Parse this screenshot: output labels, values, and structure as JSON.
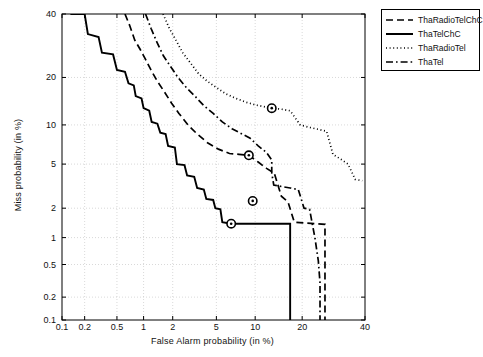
{
  "chart_data": {
    "type": "line",
    "title": "",
    "xlabel": "False Alarm probability (in %)",
    "ylabel": "Miss probability (in %)",
    "scale": "normal-deviate (DET)",
    "xlim": [
      0.1,
      40
    ],
    "ylim": [
      0.1,
      40
    ],
    "xticks": [
      "0.1",
      "0.2",
      "0.5",
      "1",
      "2",
      "5",
      "10",
      "20",
      "40"
    ],
    "xtick_values": [
      0.1,
      0.2,
      0.5,
      1,
      2,
      5,
      10,
      20,
      40
    ],
    "yticks": [
      "40",
      "20",
      "10",
      "5",
      "2",
      "1",
      "0.5",
      "0.2",
      "0.1"
    ],
    "ytick_values": [
      40,
      20,
      10,
      5,
      2,
      1,
      0.5,
      0.2,
      0.1
    ],
    "grid": true,
    "legend_position": "top-right-outside",
    "series": [
      {
        "name": "ThaRadioTelChC",
        "style": "dashed",
        "color": "#000000",
        "eer_marker": {
          "x": 9.0,
          "y": 5.9
        },
        "points": [
          [
            0.62,
            40.0
          ],
          [
            0.7,
            36.0
          ],
          [
            0.8,
            31.0
          ],
          [
            0.92,
            28.0
          ],
          [
            1.05,
            25.0
          ],
          [
            1.2,
            22.0
          ],
          [
            1.4,
            19.0
          ],
          [
            1.65,
            16.5
          ],
          [
            1.95,
            14.0
          ],
          [
            2.3,
            12.0
          ],
          [
            2.8,
            10.0
          ],
          [
            3.4,
            8.6
          ],
          [
            4.2,
            7.4
          ],
          [
            5.2,
            6.6
          ],
          [
            6.4,
            6.1
          ],
          [
            7.6,
            6.0
          ],
          [
            9.0,
            5.9
          ],
          [
            10.5,
            5.2
          ],
          [
            12.0,
            4.6
          ],
          [
            13.5,
            4.2
          ],
          [
            15.0,
            2.6
          ],
          [
            16.5,
            2.3
          ],
          [
            18.0,
            1.45
          ],
          [
            21.0,
            1.42
          ],
          [
            24.0,
            1.4
          ],
          [
            26.5,
            1.38
          ],
          [
            26.5,
            0.1
          ]
        ]
      },
      {
        "name": "ThaTelChC",
        "style": "solid",
        "color": "#000000",
        "eer_marker": {
          "x": 6.6,
          "y": 1.4
        },
        "points": [
          [
            0.13,
            40.0
          ],
          [
            0.2,
            40.0
          ],
          [
            0.22,
            33.0
          ],
          [
            0.3,
            32.0
          ],
          [
            0.33,
            27.0
          ],
          [
            0.45,
            26.5
          ],
          [
            0.5,
            22.0
          ],
          [
            0.62,
            21.5
          ],
          [
            0.68,
            18.5
          ],
          [
            0.78,
            18.0
          ],
          [
            0.82,
            15.5
          ],
          [
            0.95,
            15.0
          ],
          [
            1.0,
            13.0
          ],
          [
            1.15,
            12.5
          ],
          [
            1.22,
            10.5
          ],
          [
            1.4,
            10.2
          ],
          [
            1.5,
            8.8
          ],
          [
            1.7,
            8.6
          ],
          [
            1.8,
            7.0
          ],
          [
            2.1,
            6.8
          ],
          [
            2.2,
            5.0
          ],
          [
            2.6,
            4.9
          ],
          [
            2.75,
            4.0
          ],
          [
            3.2,
            3.9
          ],
          [
            3.4,
            3.1
          ],
          [
            3.9,
            3.0
          ],
          [
            4.1,
            2.45
          ],
          [
            4.7,
            2.4
          ],
          [
            4.9,
            2.0
          ],
          [
            5.4,
            1.95
          ],
          [
            5.6,
            1.45
          ],
          [
            6.6,
            1.4
          ],
          [
            9.0,
            1.4
          ],
          [
            12.0,
            1.4
          ],
          [
            15.0,
            1.4
          ],
          [
            17.0,
            1.4
          ],
          [
            17.0,
            0.1
          ]
        ]
      },
      {
        "name": "ThaRadioTel",
        "style": "dotted",
        "color": "#000000",
        "eer_marker": {
          "x": 13.0,
          "y": 13.0
        },
        "points": [
          [
            1.6,
            40.0
          ],
          [
            1.85,
            35.0
          ],
          [
            2.15,
            31.0
          ],
          [
            2.5,
            27.0
          ],
          [
            2.95,
            24.0
          ],
          [
            3.5,
            21.0
          ],
          [
            4.2,
            19.0
          ],
          [
            5.0,
            17.5
          ],
          [
            6.0,
            16.0
          ],
          [
            7.2,
            15.0
          ],
          [
            8.6,
            14.2
          ],
          [
            10.2,
            13.6
          ],
          [
            13.0,
            13.0
          ],
          [
            15.0,
            12.8
          ],
          [
            17.0,
            12.5
          ],
          [
            19.5,
            10.0
          ],
          [
            22.0,
            9.6
          ],
          [
            24.5,
            9.3
          ],
          [
            27.0,
            9.0
          ],
          [
            29.0,
            6.0
          ],
          [
            31.5,
            5.5
          ],
          [
            34.0,
            5.0
          ],
          [
            36.5,
            3.7
          ],
          [
            39.0,
            3.6
          ]
        ]
      },
      {
        "name": "ThaTel",
        "style": "dashdot",
        "color": "#000000",
        "eer_marker": {
          "x": 9.6,
          "y": 2.35
        },
        "points": [
          [
            1.05,
            40.0
          ],
          [
            1.2,
            35.0
          ],
          [
            1.4,
            30.0
          ],
          [
            1.62,
            26.0
          ],
          [
            1.9,
            23.0
          ],
          [
            2.25,
            20.0
          ],
          [
            2.7,
            17.5
          ],
          [
            3.25,
            15.5
          ],
          [
            3.9,
            13.5
          ],
          [
            4.7,
            12.0
          ],
          [
            5.6,
            10.5
          ],
          [
            6.7,
            9.4
          ],
          [
            8.0,
            8.6
          ],
          [
            9.2,
            8.0
          ],
          [
            10.5,
            7.0
          ],
          [
            12.0,
            6.2
          ],
          [
            13.0,
            5.4
          ],
          [
            13.0,
            4.2
          ],
          [
            13.4,
            3.3
          ],
          [
            15.0,
            3.2
          ],
          [
            17.0,
            3.1
          ],
          [
            19.0,
            3.0
          ],
          [
            20.5,
            2.0
          ],
          [
            22.0,
            1.95
          ],
          [
            23.5,
            1.0
          ],
          [
            24.5,
            0.55
          ],
          [
            25.0,
            0.3
          ],
          [
            25.0,
            0.1
          ]
        ]
      }
    ],
    "eer_markers": [
      {
        "series": "ThaRadioTel",
        "x": 13.0,
        "y": 13.0
      },
      {
        "series": "ThaRadioTelChC",
        "x": 9.0,
        "y": 5.9
      },
      {
        "series": "ThaTel",
        "x": 9.6,
        "y": 2.35
      },
      {
        "series": "ThaTelChC",
        "x": 6.6,
        "y": 1.4
      }
    ]
  },
  "legend": {
    "items": [
      {
        "label": "ThaRadioTelChC",
        "style": "dashed"
      },
      {
        "label": "ThaTelChC",
        "style": "solid"
      },
      {
        "label": "ThaRadioTel",
        "style": "dotted"
      },
      {
        "label": "ThaTel",
        "style": "dashdot"
      }
    ]
  },
  "colors": {
    "axis": "#000000",
    "grid": "#c8c8c8",
    "curve": "#000000",
    "background": "#ffffff"
  }
}
